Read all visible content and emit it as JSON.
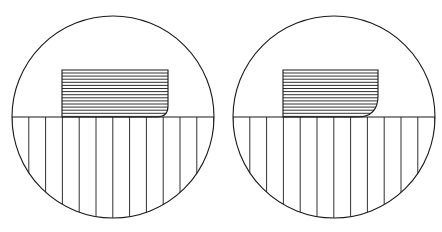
{
  "figure": {
    "title": "Two hatched circular diagrams",
    "background_color": "#ffffff",
    "stroke_color": "#1a1a1a",
    "width": 442,
    "height": 232,
    "panel_count": 2
  },
  "chart_data": {
    "type": "diagram",
    "title": "Two hatched circular diagrams",
    "xlabel": "",
    "ylabel": "",
    "grid": false,
    "legend": null,
    "panels": [
      {
        "name": "left-panel",
        "label": "Left circle",
        "circle": {
          "center_x": 113,
          "center_y": 117,
          "radius": 101,
          "stroke_width": 1.1
        },
        "diameter_line": {
          "y": 117,
          "x_start": 12,
          "x_end": 214,
          "stroke_width": 1.2
        },
        "lower_hatch": {
          "orientation": "vertical",
          "line_count": 13,
          "spacing": 16.8,
          "first_x": 12,
          "stroke_width": 0.9,
          "region": "lower-semicircle"
        },
        "upper_shape": {
          "name": "horizontally-hatched-rounded-rect",
          "x": 62,
          "y": 70,
          "width": 106,
          "height": 47,
          "corner_radius_bottom_right": 11,
          "corner_radius_bottom_left": 0,
          "corner_radius_top_left": 0,
          "corner_radius_top_right": 0,
          "stroke_width": 1.1
        },
        "upper_hatch": {
          "orientation": "horizontal",
          "line_count": 15,
          "spacing": 3.1,
          "first_y": 73,
          "stroke_width": 0.9
        }
      },
      {
        "name": "right-panel",
        "label": "Right circle",
        "circle": {
          "center_x": 334,
          "center_y": 117,
          "radius": 101,
          "stroke_width": 1.1
        },
        "diameter_line": {
          "y": 117,
          "x_start": 233,
          "x_end": 435,
          "stroke_width": 1.2
        },
        "lower_hatch": {
          "orientation": "vertical",
          "line_count": 13,
          "spacing": 16.8,
          "first_x": 233,
          "stroke_width": 0.9,
          "region": "lower-semicircle"
        },
        "upper_shape": {
          "name": "horizontally-hatched-rounded-rect",
          "x": 283,
          "y": 70,
          "width": 95,
          "height": 47,
          "corner_radius_bottom_right": 21,
          "corner_radius_bottom_left": 0,
          "corner_radius_top_left": 0,
          "corner_radius_top_right": 0,
          "stroke_width": 1.1
        },
        "upper_hatch": {
          "orientation": "horizontal",
          "line_count": 15,
          "spacing": 3.1,
          "first_y": 73,
          "stroke_width": 0.9
        }
      }
    ]
  }
}
